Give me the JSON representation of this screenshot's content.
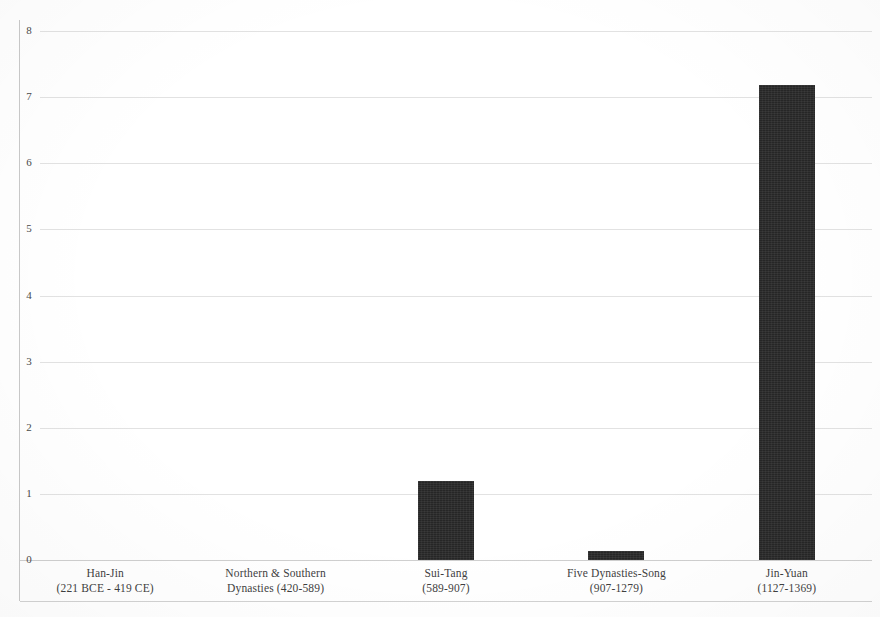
{
  "chart_data": {
    "type": "bar",
    "title": "",
    "subtitle": "",
    "xlabel": "",
    "ylabel": "",
    "ylim": [
      0,
      8
    ],
    "yticks": [
      0,
      1,
      2,
      3,
      4,
      5,
      6,
      7,
      8
    ],
    "ytick_labels": [
      "0",
      "1",
      "2",
      "3",
      "4",
      "5",
      "6",
      "7",
      "8"
    ],
    "grid": "horizontal",
    "legend": "none",
    "bar_color": "#262626",
    "gridline_color": "#e2e2e2",
    "axis_color": "#c9c9c9",
    "categories": [
      "Han-Jin\n(221 BCE - 419 CE)",
      "Northern & Southern\nDynasties (420-589)",
      "Sui-Tang\n(589-907)",
      "Five Dynasties-Song\n(907-1279)",
      "Jin-Yuan\n(1127-1369)"
    ],
    "category_lines": [
      {
        "line1": "Han-Jin",
        "line2": "(221 BCE - 419 CE)"
      },
      {
        "line1": "Northern & Southern",
        "line2": "Dynasties (420-589)"
      },
      {
        "line1": "Sui-Tang",
        "line2": "(589-907)"
      },
      {
        "line1": "Five Dynasties-Song",
        "line2": "(907-1279)"
      },
      {
        "line1": "Jin-Yuan",
        "line2": "(1127-1369)"
      }
    ],
    "values": [
      0,
      0,
      1.2,
      0.13,
      7.19
    ]
  }
}
